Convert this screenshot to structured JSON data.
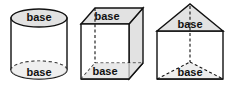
{
  "figure": {
    "background_color": "#ffffff",
    "stroke_color": "#111111",
    "face_fill_color": "#e2e2e2",
    "body_fill_color": "#ffffff",
    "hidden_edge_style": "dashed",
    "label_text": "base",
    "shapes": [
      {
        "name": "cylinder",
        "label_top": "base",
        "label_bottom": "base",
        "bases": 2,
        "base_shape": "circle"
      },
      {
        "name": "rectangular-prism",
        "label_top": "base",
        "label_bottom": "base",
        "bases": 2,
        "base_shape": "rectangle"
      },
      {
        "name": "triangular-prism",
        "label_top": "base",
        "label_bottom": "base",
        "bases": 2,
        "base_shape": "triangle"
      }
    ]
  },
  "labels": {
    "cylinder_top": "base",
    "cylinder_bottom": "base",
    "prism_top": "base",
    "prism_bottom": "base",
    "triprism_top": "base",
    "triprism_bottom": "base"
  }
}
